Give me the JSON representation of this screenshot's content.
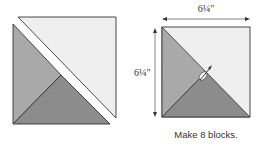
{
  "diagram": {
    "left_figure": {
      "description": "two-piece unit separated: light half-square triangle above diagonal, lower unit split into medium and dark triangles"
    },
    "right_figure": {
      "width_label": "6¼\"",
      "height_label": "6¼\"",
      "caption": "Make 8 blocks."
    },
    "colors": {
      "light": "#efefef",
      "medium": "#a9a9a9",
      "dark": "#8c8c8c",
      "outline": "#333333",
      "gap": "#ffffff"
    }
  }
}
